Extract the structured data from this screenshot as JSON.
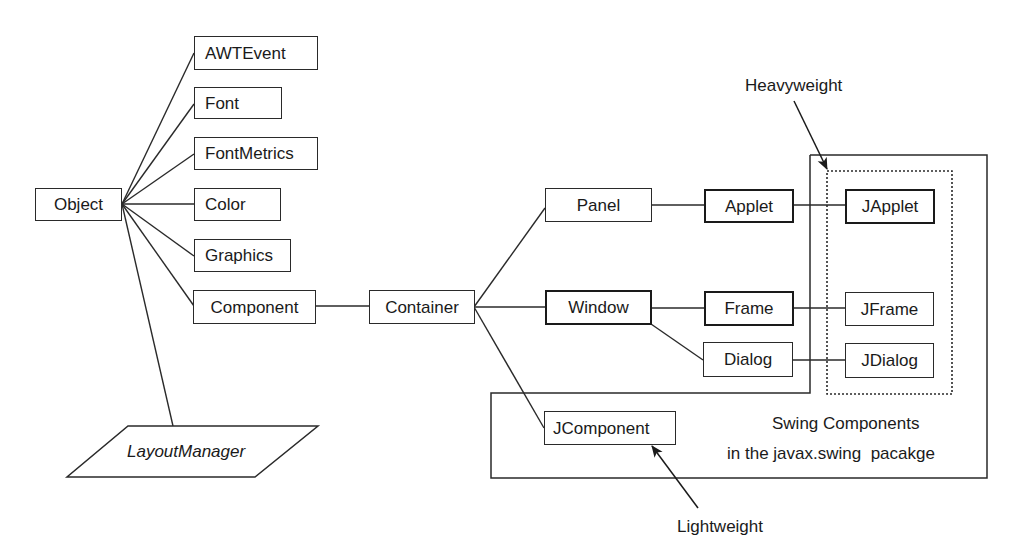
{
  "diagram": {
    "type": "class-hierarchy",
    "nodes": {
      "object": "Object",
      "awtevent": "AWTEvent",
      "font": "Font",
      "fontmetrics": "FontMetrics",
      "color": "Color",
      "graphics": "Graphics",
      "component": "Component",
      "layoutmanager": "LayoutManager",
      "container": "Container",
      "panel": "Panel",
      "applet": "Applet",
      "window": "Window",
      "frame": "Frame",
      "dialog": "Dialog",
      "jcomponent": "JComponent",
      "japplet": "JApplet",
      "jframe": "JFrame",
      "jdialog": "JDialog"
    },
    "edges": [
      [
        "Object",
        "AWTEvent"
      ],
      [
        "Object",
        "Font"
      ],
      [
        "Object",
        "FontMetrics"
      ],
      [
        "Object",
        "Color"
      ],
      [
        "Object",
        "Graphics"
      ],
      [
        "Object",
        "Component"
      ],
      [
        "Object",
        "LayoutManager"
      ],
      [
        "Component",
        "Container"
      ],
      [
        "Container",
        "Panel"
      ],
      [
        "Container",
        "Window"
      ],
      [
        "Container",
        "JComponent"
      ],
      [
        "Panel",
        "Applet"
      ],
      [
        "Applet",
        "JApplet"
      ],
      [
        "Window",
        "Frame"
      ],
      [
        "Window",
        "Dialog"
      ],
      [
        "Frame",
        "JFrame"
      ],
      [
        "Dialog",
        "JDialog"
      ]
    ],
    "annotations": {
      "heavyweight": "Heavyweight",
      "lightweight": "Lightweight",
      "swing_line1": "Swing Components",
      "swing_line2": "in the javax.swing  pacakge"
    },
    "colors": {
      "stroke": "#2a2a2a",
      "background": "#ffffff"
    }
  }
}
